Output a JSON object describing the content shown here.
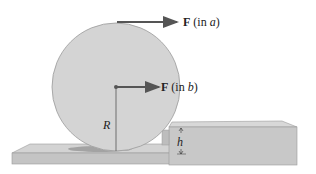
{
  "diagram": {
    "force_a": {
      "symbol": "F",
      "label": " (in ",
      "case": "a",
      "close": ")"
    },
    "force_b": {
      "symbol": "F",
      "label": " (in ",
      "case": "b",
      "close": ")"
    },
    "radius_label": "R",
    "height_label": "h"
  },
  "colors": {
    "wheel": "#d4d4d4",
    "wheel_edge": "#9a9a9a",
    "arrow": "#555555",
    "block_top": "#d6d6d6",
    "block_front": "#c6c6c6",
    "shadow": "#8e8e8e"
  }
}
